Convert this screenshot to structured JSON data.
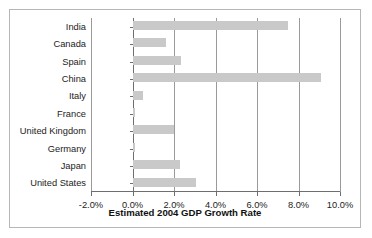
{
  "chart_data": {
    "type": "bar",
    "orientation": "horizontal",
    "title": "",
    "xlabel": "Estimated 2004 GDP Growth Rate",
    "ylabel": "",
    "xlim": [
      -2.0,
      10.0
    ],
    "xtick_labels": [
      "-2.0%",
      "0.0%",
      "2.0%",
      "4.0%",
      "6.0%",
      "8.0%",
      "10.0%"
    ],
    "xtick_values": [
      -2.0,
      0.0,
      2.0,
      4.0,
      6.0,
      8.0,
      10.0
    ],
    "grid": "vertical",
    "legend": "none",
    "units": "percent",
    "categories": [
      "India",
      "Canada",
      "Spain",
      "China",
      "Italy",
      "France",
      "United Kingdom",
      "Germany",
      "Japan",
      "United States"
    ],
    "values": [
      7.5,
      1.6,
      2.35,
      9.1,
      0.5,
      0.1,
      2.0,
      0.1,
      2.3,
      3.05
    ],
    "bar_color": "#c9c9c9",
    "axis_color": "#6e6e6e",
    "gridline_color": "#9a9a9a",
    "frame_color": "#b6b6b6",
    "background_color": "#ffffff"
  }
}
